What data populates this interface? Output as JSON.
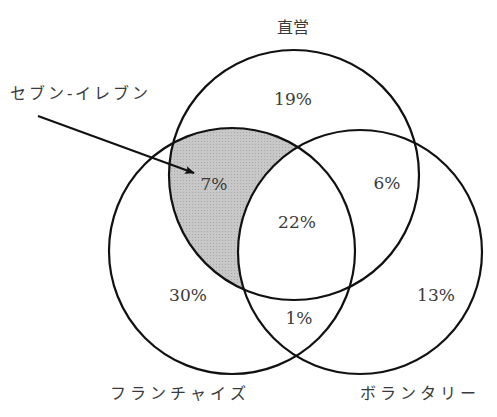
{
  "diagram": {
    "type": "venn",
    "sets": [
      {
        "id": "direct",
        "label": "直営"
      },
      {
        "id": "franchise",
        "label": "フランチャイズ"
      },
      {
        "id": "voluntary",
        "label": "ボランタリー"
      }
    ],
    "regions": {
      "direct_only": "19%",
      "franchise_only": "30%",
      "voluntary_only": "13%",
      "direct_franchise_only": "7%",
      "direct_voluntary_only": "6%",
      "franchise_voluntary_only": "1%",
      "all_three": "22%"
    },
    "callout": {
      "label": "セブン-イレブン",
      "target_region": "direct_franchise_only"
    },
    "colors": {
      "stroke": "#111111",
      "highlight_fill": "#c4c4c4",
      "text": "#3a3a3a"
    }
  }
}
